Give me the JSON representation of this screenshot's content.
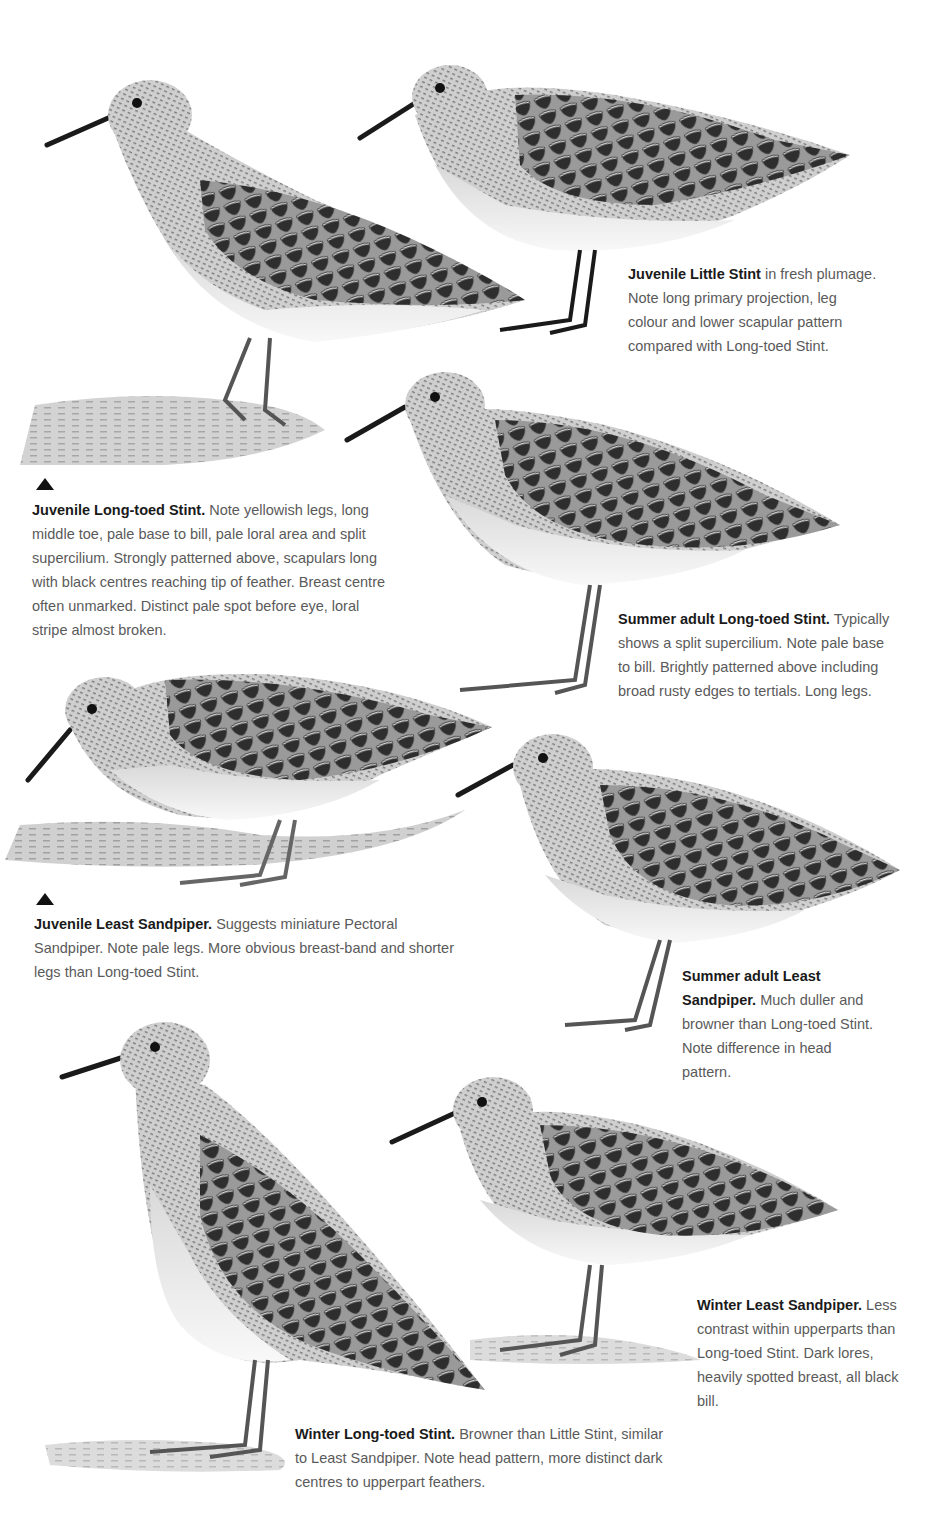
{
  "page": {
    "type": "field-guide-plate",
    "background": "#ffffff",
    "text_color": "#5a5a5a",
    "title_color": "#1a1a1a"
  },
  "plates": [
    {
      "id": "juvenile-long-toed-stint",
      "title": "Juvenile Long-toed Stint.",
      "text": "Note yellowish legs, long middle toe, pale base to bill, pale loral area and split supercilium. Strongly patterned above, scapulars long with black centres reaching tip of feather. Breast centre often unmarked. Distinct pale spot before eye, loral stripe almost broken.",
      "pointer": "up-triangle"
    },
    {
      "id": "juvenile-little-stint",
      "title": "Juvenile Little Stint",
      "text": "in fresh plumage. Note long primary projection, leg colour and lower scapular pattern compared with Long-toed Stint."
    },
    {
      "id": "summer-adult-long-toed-stint",
      "title": "Summer adult Long-toed Stint.",
      "text": "Typically shows a split supercilium. Note pale base to bill. Brightly patterned above including broad rusty edges to tertials. Long legs."
    },
    {
      "id": "juvenile-least-sandpiper",
      "title": "Juvenile Least Sandpiper.",
      "text": "Suggests miniature Pectoral Sandpiper. Note pale legs. More obvious breast-band and shorter legs than Long-toed Stint.",
      "pointer": "up-triangle"
    },
    {
      "id": "summer-adult-least-sandpiper",
      "title": "Summer adult Least Sandpiper.",
      "text": "Much duller and browner than Long-toed Stint. Note difference in head pattern."
    },
    {
      "id": "winter-least-sandpiper",
      "title": "Winter Least Sandpiper.",
      "text": "Less contrast within upperparts than Long-toed Stint. Dark lores, heavily spotted breast, all black bill."
    },
    {
      "id": "winter-long-toed-stint",
      "title": "Winter Long-toed Stint.",
      "text": "Browner than Little Stint, similar to Least Sandpiper. Note head pattern, more distinct dark centres to upperpart feathers."
    }
  ]
}
